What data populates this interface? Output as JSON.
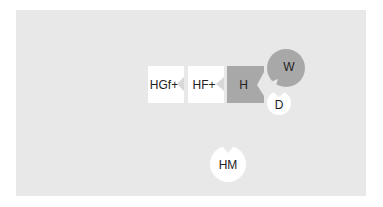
{
  "diagram": {
    "nodes": [
      {
        "id": "hgf",
        "label": "HGf+",
        "shape": "square",
        "fill": "#ffffff"
      },
      {
        "id": "hf",
        "label": "HF+",
        "shape": "square",
        "fill": "#ffffff"
      },
      {
        "id": "h",
        "label": "H",
        "shape": "square",
        "fill": "#a8a8a8"
      },
      {
        "id": "w",
        "label": "W",
        "shape": "circle",
        "fill": "#a8a8a8"
      },
      {
        "id": "d",
        "label": "D",
        "shape": "circle",
        "fill": "#ffffff"
      },
      {
        "id": "hm",
        "label": "HM",
        "shape": "circle",
        "fill": "#ffffff"
      }
    ],
    "background": "#e8e8e8"
  }
}
